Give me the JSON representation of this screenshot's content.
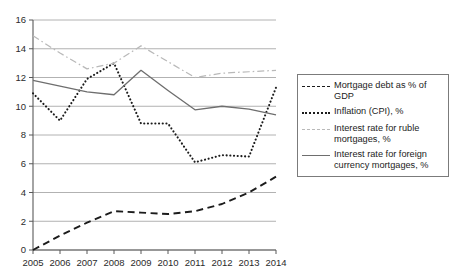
{
  "chart_data": {
    "type": "line",
    "title": "",
    "xlabel": "",
    "ylabel": "",
    "x": [
      2005,
      2006,
      2007,
      2008,
      2009,
      2010,
      2011,
      2012,
      2013,
      2014
    ],
    "categories": [
      "2005",
      "2006",
      "2007",
      "2008",
      "2009",
      "2010",
      "2011",
      "2012",
      "2013",
      "2014"
    ],
    "xlim": [
      2005,
      2014
    ],
    "ylim": [
      0,
      16
    ],
    "yticks": [
      0,
      2,
      4,
      6,
      8,
      10,
      12,
      14,
      16
    ],
    "ytick_labels": [
      "0",
      "2",
      "4",
      "6",
      "8",
      "10",
      "12",
      "14",
      "16"
    ],
    "grid": true,
    "grid_axis": "y",
    "legend_position": "right",
    "series": [
      {
        "name": "Mortgage debt as % of GDP",
        "style": "dashed",
        "color": "#1c1c1c",
        "values": [
          0.0,
          1.0,
          1.9,
          2.7,
          2.6,
          2.5,
          2.7,
          3.2,
          4.0,
          5.1
        ]
      },
      {
        "name": "Inflation (CPI), %",
        "style": "dotted",
        "color": "#1c1c1c",
        "values": [
          10.9,
          9.0,
          11.9,
          13.0,
          8.8,
          8.8,
          6.1,
          6.6,
          6.5,
          11.3
        ]
      },
      {
        "name": "Interest rate for ruble mortgages, %",
        "style": "dashdot",
        "color": "#b9b9b9",
        "values": [
          14.9,
          13.7,
          12.6,
          13.0,
          14.2,
          13.1,
          12.0,
          12.3,
          12.4,
          12.5
        ]
      },
      {
        "name": "Interest rate for foreign currency mortgages, %",
        "style": "solid",
        "color": "#6e6e6e",
        "values": [
          11.8,
          11.4,
          11.0,
          10.8,
          12.5,
          11.1,
          9.75,
          10.0,
          9.8,
          9.4
        ]
      }
    ]
  },
  "legend": {
    "items": [
      {
        "label": "Mortgage debt as % of GDP",
        "key": "dashed-line-key"
      },
      {
        "label": "Inflation (CPI), %",
        "key": "dotted-line-key"
      },
      {
        "label": "Interest rate for ruble mortgages, %",
        "key": "dashdot-line-key"
      },
      {
        "label": "Interest rate for foreign currency mortgages, %",
        "key": "solid-line-key"
      }
    ]
  },
  "colors": {
    "axis": "#595959",
    "grid": "#9e9e9e",
    "text": "#1c1c1c",
    "series_dashed": "#1c1c1c",
    "series_dotted": "#1c1c1c",
    "series_dashdot": "#b9b9b9",
    "series_solid": "#6e6e6e",
    "legend_border": "#7b7b7b",
    "background": "#ffffff"
  }
}
